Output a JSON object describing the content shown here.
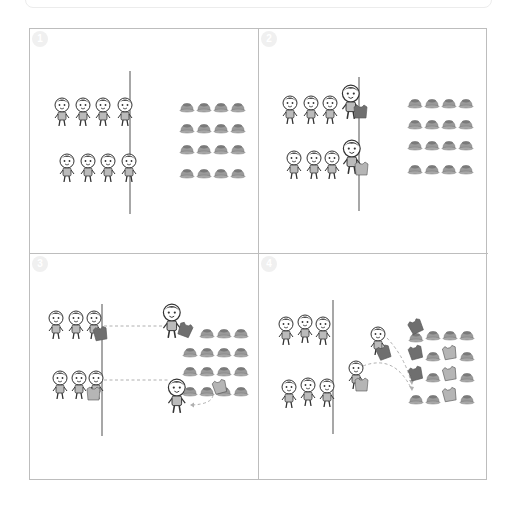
{
  "diagram": {
    "title": "",
    "layout": "2x2 step panels",
    "colors": {
      "border": "#bdbdbd",
      "start_line": "#8a8a8a",
      "cone": "#9a9a9a",
      "cone_dark": "#7a7a7a",
      "bib_dark": "#6f6f6f",
      "bib_light": "#b5b5b5",
      "dashed_path": "#b0b0b0",
      "badge_bg": "#f0f0f0"
    },
    "panels": [
      {
        "step": "1",
        "description": "Two teams of 4 kids line up behind the start line; 4x4 grid of cones on the right",
        "team_top": 4,
        "team_bottom": 4,
        "cone_grid": {
          "rows": 4,
          "cols": 4
        }
      },
      {
        "step": "2",
        "description": "Front runner of each team at the line holding a bib",
        "team_top": 4,
        "team_bottom": 4,
        "cone_grid": {
          "rows": 4,
          "cols": 4
        }
      },
      {
        "step": "3",
        "description": "Runners dash to the cones and place the bib on a cone, then return",
        "team_top": 3,
        "team_bottom": 3,
        "cone_grid": {
          "rows": 4,
          "cols": 4
        }
      },
      {
        "step": "4",
        "description": "Next runners carry bibs to cones; several cones are covered with bibs",
        "team_top": 3,
        "team_bottom": 3,
        "cone_grid": {
          "rows": 4,
          "cols": 4
        }
      }
    ]
  }
}
